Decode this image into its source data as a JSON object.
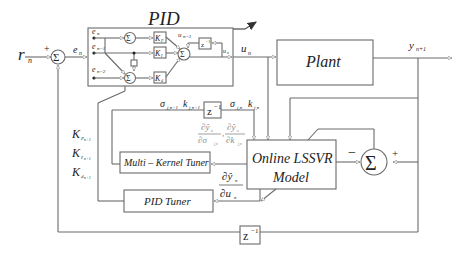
{
  "diagram": {
    "title": "PID",
    "signals": {
      "reference": "r",
      "reference_sub": "n",
      "error": "e",
      "error_sub": "n",
      "control": "u",
      "control_sub": "n",
      "output": "y",
      "output_sub": "n+1",
      "plus": "+",
      "minus": "−"
    },
    "pid_block": {
      "inputs": [
        {
          "label": "e",
          "sub": "n"
        },
        {
          "label": "e",
          "sub": "n−1"
        },
        {
          "label": "e",
          "sub": "n−2"
        }
      ],
      "gains": [
        "K",
        "K",
        "K"
      ],
      "gain_subs": [
        "P",
        "I",
        "d"
      ],
      "sum_symbol": "Σ",
      "prev_control": "u",
      "prev_control_sub": "n−1",
      "delay": "z",
      "delay_exp": "−1",
      "out_label": "u",
      "out_sub": "n"
    },
    "blocks": {
      "plant": "Plant",
      "lssvr_line1": "Online LSSVR",
      "lssvr_line2": "Model",
      "multi_kernel_tuner": "Multi – Kernel Tuner",
      "pid_tuner": "PID Tuner",
      "delay_top": "z",
      "delay_top_exp": "−1",
      "delay_bottom": "z",
      "delay_bottom_exp": "−1"
    },
    "kernel_params": {
      "next_sigma": "σ",
      "next_sigma_sub": "j,n+1",
      "next_k": "k",
      "next_k_sub": "j,n+1",
      "cur_sigma": "σ",
      "cur_sigma_sub": "j,n",
      "cur_k": "k",
      "cur_k_sub": "j,n"
    },
    "gradients": {
      "dy_dsigma_num": "∂ŷ",
      "dy_dsigma_num_sub": "n",
      "dy_dsigma_den": "∂σ",
      "dy_dsigma_den_sub": "j,n",
      "comma": ",",
      "dy_dk_num": "∂ŷ",
      "dy_dk_num_sub": "n",
      "dy_dk_den": "∂k",
      "dy_dk_den_sub": "j,n",
      "dy_du_num": "∂ŷ",
      "dy_du_num_sub": "n",
      "dy_du_den": "∂u",
      "dy_du_den_sub": "n"
    },
    "gain_outputs": [
      {
        "label": "K",
        "sub": "P",
        "subsub": "n+1"
      },
      {
        "label": "K",
        "sub": "I",
        "subsub": "n+1"
      },
      {
        "label": "K",
        "sub": "d",
        "subsub": "n+1"
      }
    ]
  }
}
